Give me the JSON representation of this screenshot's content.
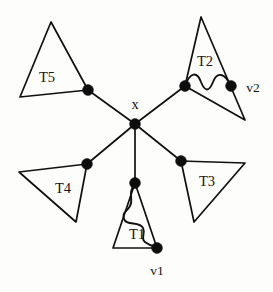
{
  "figure": {
    "type": "graph-diagram",
    "background_color": "#fdfdfc",
    "stroke_color": "#101010",
    "node_color": "#0d0d0d",
    "width": 273,
    "height": 292
  },
  "labels": {
    "center": "x",
    "t1": "T1",
    "t2": "T2",
    "t3": "T3",
    "t4": "T4",
    "t5": "T5",
    "v1": "v1",
    "v2": "v2"
  },
  "nodes": [
    {
      "id": "x",
      "label": "x",
      "cx": 135,
      "cy": 124,
      "r": 5.4,
      "label_x": 135,
      "label_y": 109
    },
    {
      "id": "n5",
      "label": "",
      "cx": 88,
      "cy": 90,
      "r": 5.4
    },
    {
      "id": "n2",
      "label": "",
      "cx": 185,
      "cy": 86,
      "r": 5.4
    },
    {
      "id": "n4",
      "label": "",
      "cx": 87,
      "cy": 164,
      "r": 5.4
    },
    {
      "id": "n3",
      "label": "",
      "cx": 181,
      "cy": 161,
      "r": 5.4
    },
    {
      "id": "n1",
      "label": "",
      "cx": 135,
      "cy": 183,
      "r": 5.4
    },
    {
      "id": "v1",
      "label": "v1",
      "cx": 157,
      "cy": 248,
      "r": 5.4,
      "label_x": 157,
      "label_y": 275
    },
    {
      "id": "v2",
      "label": "v2",
      "cx": 231,
      "cy": 86,
      "r": 5.4,
      "label_x": 253,
      "label_y": 92
    }
  ],
  "edges": [
    {
      "from": "x",
      "to": "n5"
    },
    {
      "from": "x",
      "to": "n2"
    },
    {
      "from": "x",
      "to": "n4"
    },
    {
      "from": "x",
      "to": "n3"
    },
    {
      "from": "x",
      "to": "n1"
    }
  ],
  "triangles": [
    {
      "id": "t5",
      "label": "T5",
      "points": "51,22 20,97 88,90",
      "label_x": 47,
      "label_y": 82
    },
    {
      "id": "t2",
      "label": "T2",
      "points": "201,17 185,86 245,120",
      "label_x": 205,
      "label_y": 66
    },
    {
      "id": "t4",
      "label": "T4",
      "points": "19,172 87,164 76,222",
      "label_x": 63,
      "label_y": 193
    },
    {
      "id": "t3",
      "label": "T3",
      "points": "181,161 245,163 194,222",
      "label_x": 207,
      "label_y": 186
    },
    {
      "id": "t1",
      "label": "T1",
      "points": "135,183 113,248 157,248",
      "label_x": 137,
      "label_y": 239
    }
  ],
  "curves": [
    {
      "id": "t2-wave",
      "description": "wavy path inside T2 from left node to v2",
      "d": "M 185,86 C 190,72 197,71 201,82 C 205,92 209,92 213,82 C 217,71 225,73 231,86"
    },
    {
      "id": "t1-wave",
      "description": "wavy path inside T1 from top node to v1",
      "d": "M 135,184 C 127,193 134,199 130,206 C 126,213 122,212 124,219 C 126,226 140,221 143,228 C 146,234 140,238 145,242 C 150,246 153,246 157,247"
    }
  ]
}
